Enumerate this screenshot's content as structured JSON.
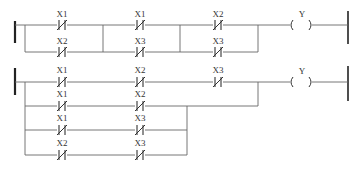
{
  "diagram_type": "ladder-logic",
  "colors": {
    "wire": "#555555",
    "rail": "#222222",
    "caption": "#c8c8c8"
  },
  "ladder1": {
    "contacts": [
      {
        "label": "X1",
        "type": "normally-closed"
      },
      {
        "label": "X2",
        "type": "normally-closed"
      },
      {
        "label": "X1",
        "type": "normally-closed"
      },
      {
        "label": "X3",
        "type": "normally-closed"
      },
      {
        "label": "X2",
        "type": "normally-closed"
      },
      {
        "label": "X3",
        "type": "normally-closed"
      }
    ],
    "coil": {
      "label": "Y"
    }
  },
  "ladder2": {
    "contacts": [
      {
        "label": "X1",
        "type": "normally-closed"
      },
      {
        "label": "X2",
        "type": "normally-closed"
      },
      {
        "label": "X3",
        "type": "normally-closed"
      },
      {
        "label": "X1",
        "type": "normally-closed"
      },
      {
        "label": "X2",
        "type": "normally-closed"
      },
      {
        "label": "X1",
        "type": "normally-closed"
      },
      {
        "label": "X3",
        "type": "normally-closed"
      },
      {
        "label": "X2",
        "type": "normally-closed"
      },
      {
        "label": "X3",
        "type": "normally-closed"
      }
    ],
    "coil": {
      "label": "Y"
    }
  },
  "caption": ""
}
